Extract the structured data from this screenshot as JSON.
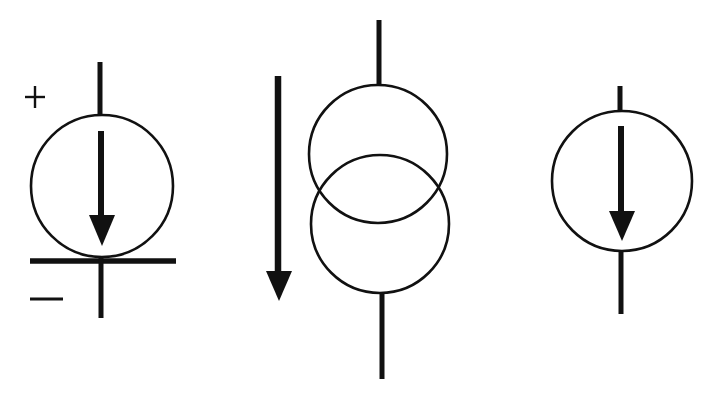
{
  "diagram": {
    "title": "Current source schematic symbols",
    "stroke_color": "#111111",
    "background_color": "#ffffff",
    "symbols": [
      {
        "id": "left",
        "label": "Current source symbol with polarity marks and ground bar",
        "plus_sign": "+",
        "minus_sign": "−",
        "circle": {
          "cx": 102,
          "cy": 186,
          "r": 71
        },
        "arrow_direction": "down"
      },
      {
        "id": "middle",
        "label": "Current source symbol with two overlapping circles and external arrow",
        "circles": [
          {
            "cx": 378,
            "cy": 154,
            "r": 69
          },
          {
            "cx": 380,
            "cy": 224,
            "r": 69
          }
        ],
        "arrow_direction": "down"
      },
      {
        "id": "right",
        "label": "Current source symbol with internal arrow",
        "circle": {
          "cx": 622,
          "cy": 181,
          "r": 70
        },
        "arrow_direction": "down"
      }
    ]
  }
}
